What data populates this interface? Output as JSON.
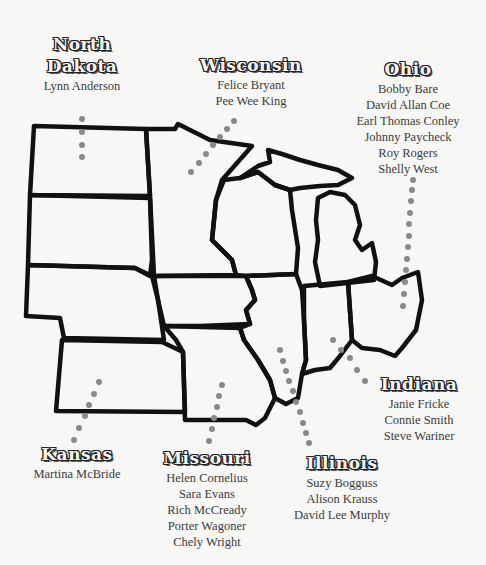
{
  "states": {
    "north_dakota": {
      "name_line1": "North",
      "name_line2": "Dakota",
      "artists": [
        "Lynn Anderson"
      ]
    },
    "wisconsin": {
      "name": "Wisconsin",
      "artists": [
        "Felice Bryant",
        "Pee Wee King"
      ]
    },
    "ohio": {
      "name": "Ohio",
      "artists": [
        "Bobby Bare",
        "David Allan Coe",
        "Earl Thomas Conley",
        "Johnny Paycheck",
        "Roy Rogers",
        "Shelly West"
      ]
    },
    "indiana": {
      "name": "Indiana",
      "artists": [
        "Janie Fricke",
        "Connie Smith",
        "Steve Wariner"
      ]
    },
    "kansas": {
      "name": "Kansas",
      "artists": [
        "Martina McBride"
      ]
    },
    "missouri": {
      "name": "Missouri",
      "artists": [
        "Helen Cornelius",
        "Sara Evans",
        "Rich McCready",
        "Porter Wagoner",
        "Chely Wright"
      ]
    },
    "illinois": {
      "name": "Illinois",
      "artists": [
        "Suzy Bogguss",
        "Alison Krauss",
        "David Lee Murphy"
      ]
    }
  },
  "colors": {
    "border": "#111111",
    "dot": "#8a8a8a",
    "background": "#f7f7f5"
  }
}
